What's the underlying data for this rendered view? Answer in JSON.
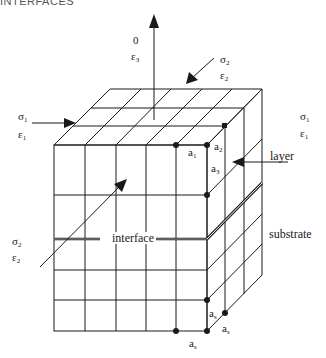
{
  "header": {
    "text": "INTERFACES"
  },
  "labels": {
    "top_stress": "0",
    "top_strain": "ε",
    "top_strain_sub": "3",
    "upper_right_sigma": "σ",
    "upper_right_sigma_sub": "2",
    "upper_right_eps": "ε",
    "upper_right_eps_sub": "2",
    "left_sigma": "σ",
    "left_sigma_sub": "1",
    "left_eps": "ε",
    "left_eps_sub": "1",
    "right_sigma": "σ",
    "right_sigma_sub": "1",
    "right_eps": "ε",
    "right_eps_sub": "1",
    "lower_left_sigma": "σ",
    "lower_left_sigma_sub": "2",
    "lower_left_eps": "ε",
    "lower_left_eps_sub": "2",
    "a1": "a",
    "a1_sub": "1",
    "a2": "a",
    "a2_sub": "2",
    "a3": "a",
    "a3_sub": "3",
    "as_vertical": "a",
    "as_vertical_sub": "s",
    "as_depth": "a",
    "as_depth_sub": "s",
    "as_horizontal": "a",
    "as_horizontal_sub": "s",
    "layer": "layer",
    "substrate": "substrate",
    "interface": "interface"
  },
  "colors": {
    "line": "#1a1a1a",
    "background": "#ffffff"
  }
}
